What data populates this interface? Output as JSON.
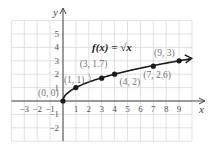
{
  "chart_data": {
    "type": "line",
    "title": "f(x) = √x",
    "function_label": "f(x) = √x",
    "xlabel": "x",
    "ylabel": "y",
    "xlim": [
      -4,
      10
    ],
    "ylim": [
      -3,
      6
    ],
    "grid": true,
    "x_ticks": [
      -3,
      -2,
      -1,
      1,
      2,
      3,
      4,
      5,
      6,
      7,
      8,
      9
    ],
    "y_ticks": [
      -2,
      -1,
      1,
      2,
      3,
      4,
      5
    ],
    "points": [
      {
        "x": 0,
        "y": 0,
        "label": "(0, 0)"
      },
      {
        "x": 1,
        "y": 1,
        "label": "(1, 1)"
      },
      {
        "x": 3,
        "y": 1.7,
        "label": "(3, 1.7)"
      },
      {
        "x": 4,
        "y": 2,
        "label": "(4, 2)"
      },
      {
        "x": 7,
        "y": 2.6,
        "label": "(7, 2.6)"
      },
      {
        "x": 9,
        "y": 3,
        "label": "(9, 3)"
      }
    ],
    "series": [
      {
        "name": "f(x) = √x",
        "curve": "sqrt",
        "x_range": [
          0,
          10
        ],
        "arrow_end": true
      }
    ]
  },
  "colors": {
    "grid": "#d9d9d9",
    "axis": "#444444",
    "curve": "#1a1a1a",
    "point_label": "#777777"
  }
}
